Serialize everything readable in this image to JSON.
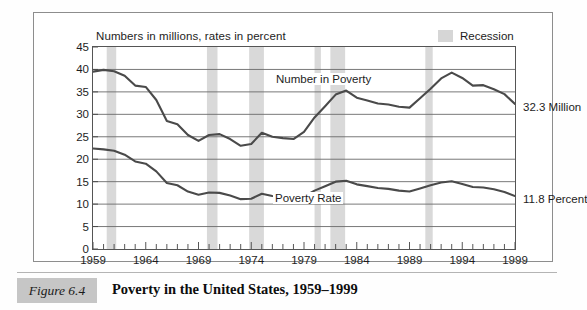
{
  "figure": {
    "note": "Numbers in millions, rates in percent",
    "caption_tag": "Figure 6.4",
    "caption_title": "Poverty in the United States, 1959–1999"
  },
  "legend": {
    "recession_label": "Recession",
    "recession_color": "#d6d6d6"
  },
  "annotations": {
    "number_end": "32.3 Million",
    "rate_end": "11.8 Percent"
  },
  "colors": {
    "line": "#4a4a4a",
    "grid": "#6a6a6a",
    "band": "#d9d9d9",
    "frame": "#555555"
  },
  "chart_data": {
    "type": "line",
    "title": "Poverty in the United States, 1959–1999",
    "subtitle": "Numbers in millions, rates in percent",
    "xlabel": "",
    "ylabel": "",
    "xlim": [
      1959,
      1999
    ],
    "ylim": [
      0,
      45
    ],
    "ytick_step": 5,
    "grid": true,
    "legend_position": "top-right",
    "xticks": [
      1959,
      1964,
      1969,
      1974,
      1979,
      1984,
      1989,
      1994,
      1999
    ],
    "yticks": [
      0,
      5,
      10,
      15,
      20,
      25,
      30,
      35,
      40,
      45
    ],
    "x": [
      1959,
      1960,
      1961,
      1962,
      1963,
      1964,
      1965,
      1966,
      1967,
      1968,
      1969,
      1970,
      1971,
      1972,
      1973,
      1974,
      1975,
      1976,
      1977,
      1978,
      1979,
      1980,
      1981,
      1982,
      1983,
      1984,
      1985,
      1986,
      1987,
      1988,
      1989,
      1990,
      1991,
      1992,
      1993,
      1994,
      1995,
      1996,
      1997,
      1998,
      1999
    ],
    "series": [
      {
        "name": "Number in Poverty",
        "units": "millions",
        "end_value": 32.3,
        "values": [
          39.5,
          39.9,
          39.6,
          38.6,
          36.4,
          36.1,
          33.2,
          28.5,
          27.8,
          25.4,
          24.1,
          25.4,
          25.6,
          24.5,
          23.0,
          23.4,
          25.9,
          25.0,
          24.7,
          24.5,
          26.1,
          29.3,
          31.8,
          34.4,
          35.3,
          33.7,
          33.1,
          32.4,
          32.2,
          31.7,
          31.5,
          33.6,
          35.7,
          38.0,
          39.3,
          38.1,
          36.4,
          36.5,
          35.6,
          34.5,
          32.3
        ]
      },
      {
        "name": "Poverty Rate",
        "units": "percent",
        "end_value": 11.8,
        "values": [
          22.4,
          22.2,
          21.9,
          21.0,
          19.5,
          19.0,
          17.3,
          14.7,
          14.2,
          12.8,
          12.1,
          12.6,
          12.5,
          11.9,
          11.1,
          11.2,
          12.3,
          11.8,
          11.6,
          11.4,
          11.7,
          13.0,
          14.0,
          15.0,
          15.2,
          14.4,
          14.0,
          13.6,
          13.4,
          13.0,
          12.8,
          13.5,
          14.2,
          14.8,
          15.1,
          14.5,
          13.8,
          13.7,
          13.3,
          12.7,
          11.8
        ]
      }
    ],
    "recession_bands": [
      {
        "start": 1960.3,
        "end": 1961.2
      },
      {
        "start": 1969.8,
        "end": 1970.8
      },
      {
        "start": 1973.8,
        "end": 1975.2
      },
      {
        "start": 1980.0,
        "end": 1980.6
      },
      {
        "start": 1981.5,
        "end": 1982.9
      },
      {
        "start": 1990.5,
        "end": 1991.2
      }
    ]
  }
}
